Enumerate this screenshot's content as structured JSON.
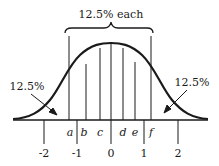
{
  "diagram": {
    "top_label": "12.5% each",
    "left_tail_label": "12.5%",
    "right_tail_label": "12.5%",
    "region_boundaries": [
      "a",
      "b",
      "c",
      "d",
      "e",
      "f"
    ],
    "axis_ticks": [
      "-2",
      "-1",
      "0",
      "1",
      "2"
    ],
    "colors": {
      "ink": "#1a1a1a",
      "background": "#ffffff"
    }
  }
}
